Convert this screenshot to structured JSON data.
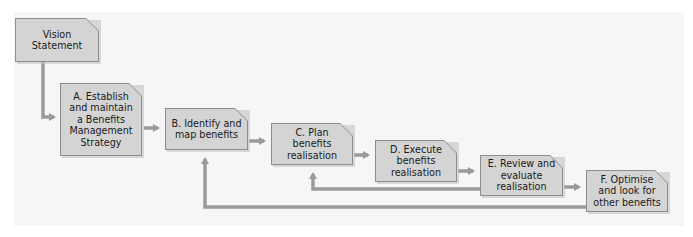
{
  "diagram": {
    "type": "process-flow",
    "nodes": [
      {
        "id": "vision",
        "label": "Vision Statement"
      },
      {
        "id": "A",
        "label": "A. Establish and maintain a Benefits Management Strategy"
      },
      {
        "id": "B",
        "label": "B. Identify and map benefits"
      },
      {
        "id": "C",
        "label": "C. Plan benefits realisation"
      },
      {
        "id": "D",
        "label": "D. Execute benefits realisation"
      },
      {
        "id": "E",
        "label": "E. Review and evaluate realisation"
      },
      {
        "id": "F",
        "label": "F. Optimise and look for other benefits"
      }
    ],
    "edges": [
      {
        "from": "vision",
        "to": "A"
      },
      {
        "from": "A",
        "to": "B"
      },
      {
        "from": "B",
        "to": "C"
      },
      {
        "from": "C",
        "to": "D"
      },
      {
        "from": "D",
        "to": "E"
      },
      {
        "from": "E",
        "to": "F"
      },
      {
        "from": "E",
        "to": "C",
        "kind": "feedback"
      },
      {
        "from": "F",
        "to": "B",
        "kind": "feedback"
      }
    ],
    "colors": {
      "box_fill": "#d4d4d4",
      "box_border": "#8e8e8e",
      "arrow": "#9a9a9a",
      "background": "#f6f6f6"
    }
  }
}
